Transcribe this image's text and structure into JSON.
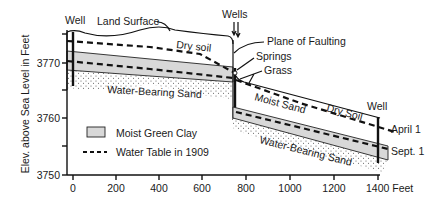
{
  "figure": {
    "y_axis_label": "Elev. above Sea Level in Feet",
    "x_axis_unit": "Feet",
    "y_ticks": [
      "3770",
      "3760",
      "3750"
    ],
    "x_ticks": [
      "0",
      "200",
      "400",
      "600",
      "800",
      "1000",
      "1200",
      "1400 Feet"
    ]
  },
  "labels": {
    "well_left": "Well",
    "land_surface": "Land Surface",
    "dry_soil_left": "Dry soil",
    "water_bearing_sand_left": "Water-Bearing Sand",
    "wells_top": "Wells",
    "plane_of_faulting": "Plane of Faulting",
    "springs": "Springs",
    "grass": "Grass",
    "moist_sand": "Moist Sand",
    "dry_soil_right": "Dry Soil",
    "well_right": "Well",
    "april_1": "April 1",
    "sept_1": "Sept. 1",
    "water_bearing_sand_right": "Water-Bearing Sand"
  },
  "legend": {
    "items": [
      {
        "label": "Moist Green Clay",
        "swatch": "fill"
      },
      {
        "label": "Water Table in 1909",
        "swatch": "dashed-line"
      }
    ]
  },
  "colors": {
    "clay": "#d8d8d8",
    "line": "#111111",
    "background": "#ffffff"
  }
}
